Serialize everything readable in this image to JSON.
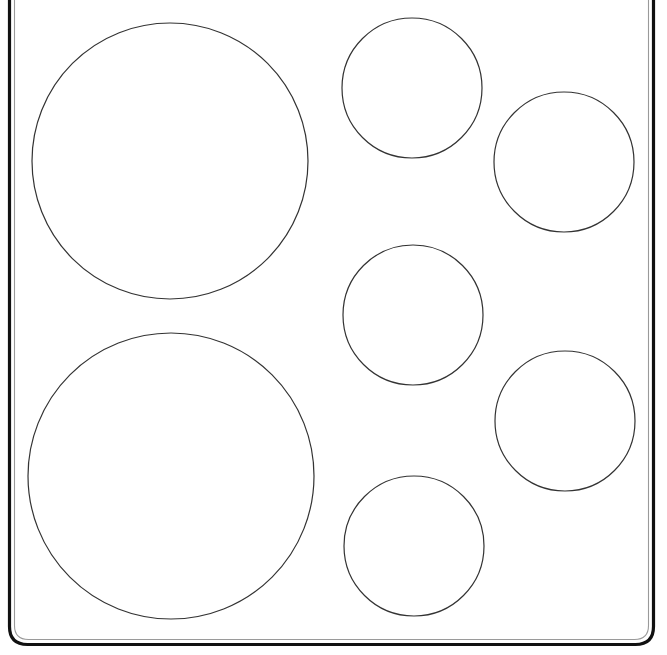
{
  "diagram": {
    "type": "cooktop-top-view",
    "canvas": {
      "width": 667,
      "height": 655
    },
    "colors": {
      "background": "#ffffff",
      "frame_outer": "#111111",
      "frame_inner": "#9a9a9a",
      "burner_stroke": "#333333"
    },
    "frame": {
      "outer": {
        "left": 9.5,
        "right": 653.5,
        "bottom": 644.5,
        "top": -20,
        "radius": 18,
        "stroke_width": 3.2
      },
      "inner": {
        "left": 14.5,
        "right": 648.5,
        "bottom": 639.5,
        "top": -20,
        "radius": 14,
        "stroke_width": 1.1
      }
    },
    "burners": [
      {
        "id": "large-top-left",
        "cx": 170,
        "cy": 161,
        "r": 138
      },
      {
        "id": "large-bottom-left",
        "cx": 171,
        "cy": 476,
        "r": 143
      },
      {
        "id": "small-top-center",
        "cx": 412,
        "cy": 88,
        "r": 70
      },
      {
        "id": "small-top-right",
        "cx": 564,
        "cy": 162,
        "r": 70
      },
      {
        "id": "small-middle-center",
        "cx": 413,
        "cy": 315,
        "r": 70
      },
      {
        "id": "small-middle-right",
        "cx": 565,
        "cy": 421,
        "r": 70
      },
      {
        "id": "small-bottom-center",
        "cx": 414,
        "cy": 546,
        "r": 70
      }
    ]
  }
}
